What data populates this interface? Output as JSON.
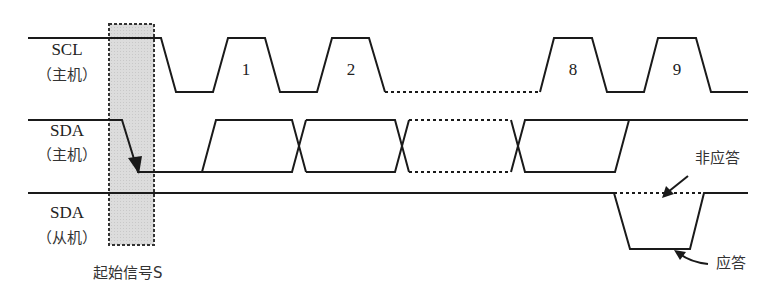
{
  "signals": [
    {
      "name": "SCL",
      "role": "（主机）"
    },
    {
      "name": "SDA",
      "role": "（主机）"
    },
    {
      "name": "SDA",
      "role": "（从机）"
    }
  ],
  "clock_labels": [
    "1",
    "2",
    "8",
    "9"
  ],
  "annotations": {
    "start": "起始信号S",
    "nack": "非应答",
    "ack": "应答"
  },
  "colors": {
    "line": "#1a1a1a",
    "start_box": "#d9d9d9"
  }
}
